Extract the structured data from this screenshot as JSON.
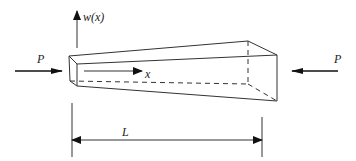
{
  "diagram": {
    "type": "tapered beam under axial compression",
    "labels": {
      "deflection": "w(x)",
      "load_left": "P",
      "load_right": "P",
      "axis": "x",
      "length": "L"
    },
    "colors": {
      "stroke": "#333333",
      "background": "#ffffff"
    }
  }
}
